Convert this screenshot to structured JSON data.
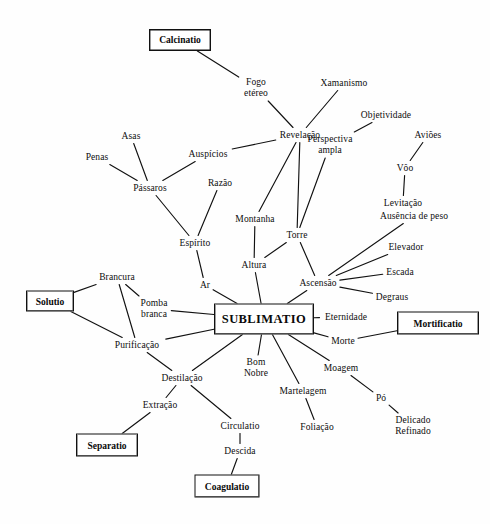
{
  "diagram": {
    "title": "SUBLIMATIO",
    "type": "concept-map",
    "language": "pt",
    "line_color": "#111111",
    "text_color": "#0d0d0d",
    "background": "#ffffff"
  },
  "stages": [
    {
      "id": "calcinatio",
      "label": "Calcinatio",
      "x": 180,
      "y": 40,
      "w": 60,
      "h": 20
    },
    {
      "id": "solutio",
      "label": "Solutio",
      "x": 50,
      "y": 301,
      "w": 46,
      "h": 19
    },
    {
      "id": "sublimatio",
      "label": "SUBLIMATIO",
      "x": 264,
      "y": 319,
      "w": 98,
      "h": 29
    },
    {
      "id": "mortificatio",
      "label": "Mortificatio",
      "x": 438,
      "y": 323,
      "w": 80,
      "h": 21
    },
    {
      "id": "separatio",
      "label": "Separatio",
      "x": 107,
      "y": 445,
      "w": 60,
      "h": 21
    },
    {
      "id": "coagulatio",
      "label": "Coagulatio",
      "x": 227,
      "y": 486,
      "w": 63,
      "h": 21
    }
  ],
  "nodes": [
    {
      "id": "fogo_etereo",
      "label": "Fogo\netéreo",
      "x": 256,
      "y": 88
    },
    {
      "id": "xamanismo",
      "label": "Xamanismo",
      "x": 344,
      "y": 83
    },
    {
      "id": "objetividade",
      "label": "Objetividade",
      "x": 386,
      "y": 115
    },
    {
      "id": "revelacao",
      "label": "Revelação",
      "x": 300,
      "y": 135
    },
    {
      "id": "avioes",
      "label": "Aviões",
      "x": 428,
      "y": 135
    },
    {
      "id": "asas",
      "label": "Asas",
      "x": 131,
      "y": 136
    },
    {
      "id": "auspicios",
      "label": "Auspícios",
      "x": 208,
      "y": 154
    },
    {
      "id": "penas",
      "label": "Penas",
      "x": 97,
      "y": 157
    },
    {
      "id": "perspectiva",
      "label": "Perspectiva\nampla",
      "x": 330,
      "y": 145
    },
    {
      "id": "voo",
      "label": "Vôo",
      "x": 405,
      "y": 168
    },
    {
      "id": "razao",
      "label": "Razão",
      "x": 220,
      "y": 183
    },
    {
      "id": "passaros",
      "label": "Pássaros",
      "x": 150,
      "y": 188
    },
    {
      "id": "levitacao",
      "label": "Levitação",
      "x": 403,
      "y": 203
    },
    {
      "id": "ausencia_peso",
      "label": "Ausência de peso",
      "x": 414,
      "y": 216
    },
    {
      "id": "montanha",
      "label": "Montanha",
      "x": 255,
      "y": 219
    },
    {
      "id": "torre",
      "label": "Torre",
      "x": 297,
      "y": 235
    },
    {
      "id": "espirito",
      "label": "Espírito",
      "x": 195,
      "y": 243
    },
    {
      "id": "elevador",
      "label": "Elevador",
      "x": 406,
      "y": 247
    },
    {
      "id": "altura",
      "label": "Altura",
      "x": 254,
      "y": 265
    },
    {
      "id": "escada",
      "label": "Escada",
      "x": 400,
      "y": 272
    },
    {
      "id": "brancura",
      "label": "Brancura",
      "x": 117,
      "y": 277
    },
    {
      "id": "ar",
      "label": "Ar",
      "x": 205,
      "y": 285
    },
    {
      "id": "ascensao",
      "label": "Ascensão",
      "x": 318,
      "y": 283
    },
    {
      "id": "degraus",
      "label": "Degraus",
      "x": 392,
      "y": 297
    },
    {
      "id": "pomba_branca",
      "label": "Pomba\nbranca",
      "x": 154,
      "y": 309
    },
    {
      "id": "eternidade",
      "label": "Eternidade",
      "x": 346,
      "y": 317
    },
    {
      "id": "morte",
      "label": "Morte",
      "x": 343,
      "y": 341
    },
    {
      "id": "purificacao",
      "label": "Purificação",
      "x": 137,
      "y": 345
    },
    {
      "id": "bom_nobre",
      "label": "Bom\nNobre",
      "x": 256,
      "y": 368
    },
    {
      "id": "moagem",
      "label": "Moagem",
      "x": 341,
      "y": 368
    },
    {
      "id": "destilacao",
      "label": "Destilação",
      "x": 182,
      "y": 378
    },
    {
      "id": "martelagem",
      "label": "Martelagem",
      "x": 303,
      "y": 391
    },
    {
      "id": "po",
      "label": "Pó",
      "x": 381,
      "y": 398
    },
    {
      "id": "extracao",
      "label": "Extração",
      "x": 160,
      "y": 405
    },
    {
      "id": "delicado_refinado",
      "label": "Delicado\nRefinado",
      "x": 413,
      "y": 426
    },
    {
      "id": "circulatio",
      "label": "Circulatio",
      "x": 240,
      "y": 426
    },
    {
      "id": "foliacao",
      "label": "Foliação",
      "x": 317,
      "y": 427
    },
    {
      "id": "descida",
      "label": "Descida",
      "x": 240,
      "y": 451
    }
  ],
  "edges": [
    {
      "from": "calcinatio",
      "to": "fogo_etereo"
    },
    {
      "from": "fogo_etereo",
      "to": "revelacao"
    },
    {
      "from": "xamanismo",
      "to": "revelacao"
    },
    {
      "from": "objetividade",
      "to": "perspectiva"
    },
    {
      "from": "revelacao",
      "to": "auspicios"
    },
    {
      "from": "revelacao",
      "to": "montanha"
    },
    {
      "from": "revelacao",
      "to": "torre"
    },
    {
      "from": "avioes",
      "to": "voo"
    },
    {
      "from": "voo",
      "to": "levitacao"
    },
    {
      "from": "asas",
      "to": "passaros"
    },
    {
      "from": "penas",
      "to": "passaros"
    },
    {
      "from": "auspicios",
      "to": "passaros"
    },
    {
      "from": "passaros",
      "to": "espirito"
    },
    {
      "from": "razao",
      "to": "espirito"
    },
    {
      "from": "espirito",
      "to": "ar"
    },
    {
      "from": "perspectiva",
      "to": "torre"
    },
    {
      "from": "montanha",
      "to": "altura"
    },
    {
      "from": "torre",
      "to": "altura"
    },
    {
      "from": "torre",
      "to": "ascensao"
    },
    {
      "from": "ausencia_peso",
      "to": "ascensao"
    },
    {
      "from": "elevador",
      "to": "ascensao"
    },
    {
      "from": "escada",
      "to": "ascensao"
    },
    {
      "from": "degraus",
      "to": "ascensao"
    },
    {
      "from": "altura",
      "to": "sublimatio"
    },
    {
      "from": "ar",
      "to": "sublimatio"
    },
    {
      "from": "ascensao",
      "to": "sublimatio"
    },
    {
      "from": "eternidade",
      "to": "sublimatio"
    },
    {
      "from": "morte",
      "to": "sublimatio"
    },
    {
      "from": "morte",
      "to": "mortificatio"
    },
    {
      "from": "solutio",
      "to": "brancura"
    },
    {
      "from": "solutio",
      "to": "purificacao"
    },
    {
      "from": "brancura",
      "to": "pomba_branca"
    },
    {
      "from": "brancura",
      "to": "purificacao"
    },
    {
      "from": "pomba_branca",
      "to": "sublimatio"
    },
    {
      "from": "purificacao",
      "to": "sublimatio"
    },
    {
      "from": "purificacao",
      "to": "destilacao"
    },
    {
      "from": "destilacao",
      "to": "sublimatio"
    },
    {
      "from": "destilacao",
      "to": "extracao"
    },
    {
      "from": "destilacao",
      "to": "circulatio"
    },
    {
      "from": "extracao",
      "to": "separatio"
    },
    {
      "from": "circulatio",
      "to": "descida"
    },
    {
      "from": "descida",
      "to": "coagulatio"
    },
    {
      "from": "bom_nobre",
      "to": "sublimatio"
    },
    {
      "from": "martelagem",
      "to": "sublimatio"
    },
    {
      "from": "martelagem",
      "to": "foliacao"
    },
    {
      "from": "moagem",
      "to": "sublimatio"
    },
    {
      "from": "moagem",
      "to": "po"
    },
    {
      "from": "po",
      "to": "delicado_refinado"
    }
  ]
}
